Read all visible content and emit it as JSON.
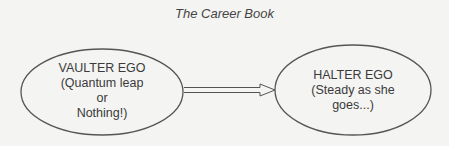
{
  "title": "The Career Book",
  "nodes": [
    {
      "id": "vaulter",
      "lines": [
        "VAULTER EGO",
        "(Quantum leap",
        "or",
        "Nothing!)"
      ]
    },
    {
      "id": "halter",
      "lines": [
        "HALTER EGO",
        "(Steady as she",
        "goes...)"
      ]
    }
  ],
  "edges": [
    {
      "from": "vaulter",
      "to": "halter",
      "style": "double-line open arrow"
    }
  ],
  "colors": {
    "background": "#f4f4f2",
    "stroke": "#555555",
    "text": "#3a3a3a"
  }
}
